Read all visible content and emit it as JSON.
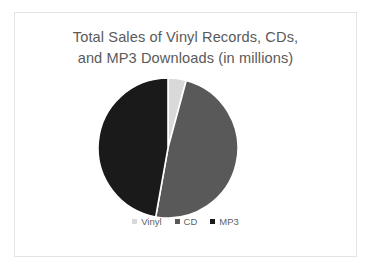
{
  "slide": {
    "background_color": "#ffffff",
    "border_color": "#e4e4e4"
  },
  "chart_title": {
    "line1": "Total Sales of Vinyl Records, CDs,",
    "line2": "and MP3 Downloads (in millions)",
    "color": "#5a5a5a"
  },
  "chart_data": {
    "type": "pie",
    "title": "Total Sales of Vinyl Records, CDs, and MP3 Downloads (in millions)",
    "xlabel": "",
    "ylabel": "",
    "categories": [
      "Vinyl",
      "CD",
      "MP3"
    ],
    "values": [
      4.2,
      48.6,
      47.2
    ],
    "percentages": [
      4.2,
      48.6,
      47.2
    ],
    "colors": [
      "#d9d9d9",
      "#595959",
      "#1a1a1a"
    ],
    "start_angle_deg": 0,
    "direction": "clockwise",
    "legend_position": "bottom",
    "grid": false,
    "units": "millions",
    "slices": [
      {
        "label": "Vinyl",
        "value": 4.2,
        "color": "#d9d9d9",
        "start_deg": 0.0,
        "end_deg": 15.1
      },
      {
        "label": "CD",
        "value": 48.6,
        "color": "#595959",
        "start_deg": 15.1,
        "end_deg": 190.1
      },
      {
        "label": "MP3",
        "value": 47.2,
        "color": "#1a1a1a",
        "start_deg": 190.1,
        "end_deg": 360.0
      }
    ]
  },
  "legend": {
    "items": [
      {
        "label": "Vinyl",
        "color": "#d9d9d9"
      },
      {
        "label": "CD",
        "color": "#595959"
      },
      {
        "label": "MP3",
        "color": "#1a1a1a"
      }
    ]
  }
}
